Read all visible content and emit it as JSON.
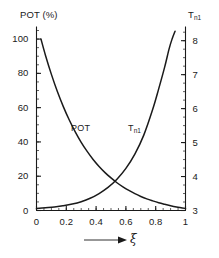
{
  "chart_data": {
    "type": "line",
    "title": "",
    "xlabel": "ξ",
    "xlabel_prefix_icon": "arrow-right-icon",
    "xlim": [
      0,
      1
    ],
    "xticks": [
      0,
      0.2,
      0.4,
      0.6,
      0.8,
      1
    ],
    "xticklabels": [
      "0",
      "0.2",
      "0.4",
      "0.6",
      "0.8",
      "1"
    ],
    "xminor_step": 0.05,
    "grid": false,
    "legend": "inline-curve-labels",
    "axes": [
      {
        "id": "left",
        "label": "POT (%)",
        "lim": [
          0,
          105
        ],
        "ticks": [
          0,
          20,
          40,
          60,
          80,
          100
        ],
        "ticklabels": [
          "0",
          "20",
          "40",
          "60",
          "80",
          "100"
        ],
        "minor_step": 5
      },
      {
        "id": "right",
        "label": "T",
        "label_sub": "n1",
        "lim": [
          3,
          8.3
        ],
        "ticks": [
          3,
          4,
          5,
          6,
          7,
          8
        ],
        "ticklabels": [
          "3",
          "4",
          "5",
          "6",
          "7",
          "8"
        ],
        "minor_step": 0.25
      }
    ],
    "series": [
      {
        "name": "POT",
        "axis": "left",
        "label_text": "POT",
        "label_sub": "",
        "x": [
          0.03,
          0.06,
          0.1,
          0.14,
          0.18,
          0.22,
          0.26,
          0.3,
          0.34,
          0.38,
          0.42,
          0.46,
          0.5,
          0.54,
          0.58,
          0.62,
          0.66,
          0.7,
          0.74,
          0.78,
          0.82,
          0.86,
          0.9,
          0.94,
          1.0
        ],
        "values": [
          100.0,
          90.6,
          79.4,
          69.4,
          60.6,
          52.8,
          45.9,
          39.8,
          34.5,
          29.8,
          25.7,
          22.1,
          19.0,
          16.2,
          13.8,
          11.7,
          9.8,
          8.2,
          6.8,
          5.6,
          4.5,
          3.6,
          2.8,
          2.1,
          1.2
        ]
      },
      {
        "name": "T_n1",
        "axis": "right",
        "label_text": "T",
        "label_sub": "n1",
        "x": [
          0.0,
          0.06,
          0.12,
          0.18,
          0.24,
          0.3,
          0.36,
          0.42,
          0.48,
          0.54,
          0.6,
          0.66,
          0.72,
          0.78,
          0.82,
          0.86,
          0.89,
          0.91,
          0.93
        ],
        "values": [
          3.06,
          3.08,
          3.1,
          3.14,
          3.19,
          3.26,
          3.36,
          3.5,
          3.68,
          3.92,
          4.24,
          4.66,
          5.22,
          5.98,
          6.58,
          7.22,
          7.76,
          8.05,
          8.28
        ]
      }
    ]
  }
}
